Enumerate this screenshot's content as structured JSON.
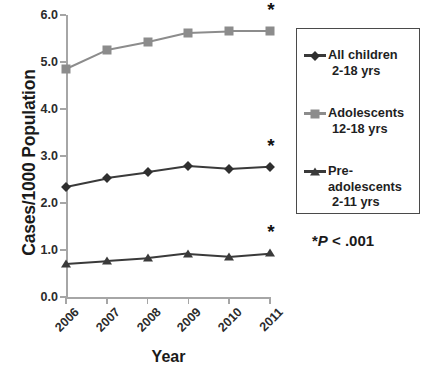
{
  "chart_data": {
    "type": "line",
    "title": "",
    "xlabel": "Year",
    "ylabel": "Cases/1000 Population",
    "categories": [
      "2006",
      "2007",
      "2008",
      "2009",
      "2010",
      "2011"
    ],
    "x": [
      2006,
      2007,
      2008,
      2009,
      2010,
      2011
    ],
    "ylim": [
      0.0,
      6.0
    ],
    "yticks": [
      "0.0",
      "1.0",
      "2.0",
      "3.0",
      "4.0",
      "5.0",
      "6.0"
    ],
    "ytick_values": [
      0.0,
      1.0,
      2.0,
      3.0,
      4.0,
      5.0,
      6.0
    ],
    "grid": false,
    "legend_position": "right",
    "series": [
      {
        "name": "All children",
        "sublabel": "2-18 yrs",
        "marker": "diamond",
        "color": "#2f2f2f",
        "values": [
          2.35,
          2.53,
          2.65,
          2.78,
          2.72,
          2.77
        ]
      },
      {
        "name": "Adolescents",
        "sublabel": "12-18 yrs",
        "marker": "square",
        "color": "#8c8c8c",
        "values": [
          4.85,
          5.25,
          5.42,
          5.62,
          5.65,
          5.65
        ]
      },
      {
        "name": "Pre-adolescents",
        "sublabel": "2-11 yrs",
        "marker": "triangle",
        "color": "#3a3a3a",
        "values": [
          0.7,
          0.76,
          0.82,
          0.92,
          0.86,
          0.93
        ]
      }
    ],
    "annotations": [
      {
        "text": "*",
        "series": "Adolescents",
        "x": "2011",
        "y": 5.65
      },
      {
        "text": "*",
        "series": "All children",
        "x": "2011",
        "y": 2.77
      },
      {
        "text": "*",
        "series": "Pre-adolescents",
        "x": "2011",
        "y": 0.93
      }
    ],
    "footnote": {
      "star": "*",
      "stat": "P",
      "operator": " < .001"
    }
  }
}
